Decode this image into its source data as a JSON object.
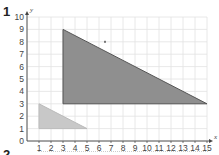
{
  "question_numbers": {
    "current": "1",
    "next": "2"
  },
  "chart_data": {
    "type": "scatter",
    "title": "",
    "xlabel": "x",
    "ylabel": "y",
    "xlim": [
      0,
      15
    ],
    "ylim": [
      0,
      10
    ],
    "grid": true,
    "x_ticks": [
      "1",
      "2",
      "3",
      "4",
      "5",
      "6",
      "7",
      "8",
      "9",
      "10",
      "11",
      "12",
      "13",
      "14",
      "15"
    ],
    "y_ticks": [
      "0",
      "1",
      "2",
      "3",
      "4",
      "5",
      "6",
      "7",
      "8",
      "9",
      "10"
    ],
    "shapes": [
      {
        "name": "large-triangle",
        "vertices": [
          [
            3,
            3
          ],
          [
            3,
            9
          ],
          [
            15,
            3
          ]
        ],
        "fill": "#8f8f8f",
        "stroke": "#555555"
      },
      {
        "name": "small-triangle",
        "vertices": [
          [
            1,
            1
          ],
          [
            1,
            3
          ],
          [
            5,
            1
          ]
        ],
        "fill": "#c8c8c8",
        "stroke": "#bbbbbb"
      }
    ],
    "points": [
      {
        "name": "marked-point",
        "x": 6.5,
        "y": 8
      }
    ]
  }
}
